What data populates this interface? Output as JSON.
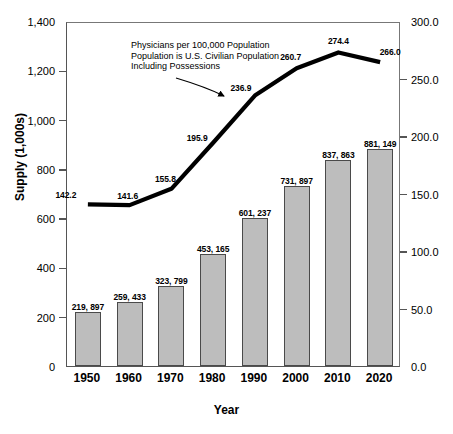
{
  "chart_data": {
    "type": "bar",
    "title": "",
    "xlabel": "Year",
    "ylabel": "Supply (1,000s)",
    "y2label": "",
    "categories": [
      "1950",
      "1960",
      "1970",
      "1980",
      "1990",
      "2000",
      "2010",
      "2020"
    ],
    "ylim": [
      0,
      1400
    ],
    "y2lim": [
      0.0,
      300.0
    ],
    "y_ticks": [
      "0",
      "200",
      "400",
      "600",
      "800",
      "1,000",
      "1,200",
      "1,400"
    ],
    "y_tick_values": [
      0,
      200,
      400,
      600,
      800,
      1000,
      1200,
      1400
    ],
    "y2_ticks": [
      "0.0",
      "50.0",
      "100.0",
      "150.0",
      "200.0",
      "250.0",
      "300.0"
    ],
    "y2_tick_values": [
      0,
      50,
      100,
      150,
      200,
      250,
      300
    ],
    "grid": false,
    "legend": "none",
    "series": [
      {
        "name": "Supply (1,000s)",
        "type": "bar",
        "axis": "left",
        "color": "#bdbdbd",
        "edge_color": "#4a4a4a",
        "values": [
          219.897,
          259.433,
          323.799,
          453.165,
          601.237,
          731.897,
          837.863,
          881.149
        ],
        "labels": [
          "219, 897",
          "259, 433",
          "323, 799",
          "453, 165",
          "601, 237",
          "731, 897",
          "837, 863",
          "881, 149"
        ]
      },
      {
        "name": "Physicians per 100,000 Population",
        "type": "line",
        "axis": "right",
        "color": "#000000",
        "values": [
          142.2,
          141.6,
          155.8,
          195.9,
          236.9,
          260.7,
          274.4,
          266.0
        ],
        "labels": [
          "142.2",
          "141.6",
          "155.8",
          "195.9",
          "236.9",
          "260.7",
          "274.4",
          "266.0"
        ]
      }
    ],
    "annotations": [
      {
        "lines": [
          "Physicians per 100,000 Population",
          "Population is U.S. Civilian Population",
          "Including Possessions"
        ]
      }
    ]
  }
}
